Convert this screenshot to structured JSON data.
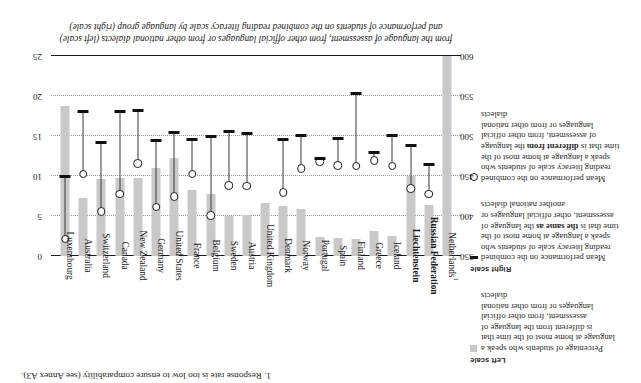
{
  "figure": {
    "caption": "from the language of assessment, from other official languages or from other national dialects (left scale) and performance of students on the combined reading literacy scale by language group (right scale)",
    "footnote": "1. Response rate is too low to ensure comparability (see Annex A3)."
  },
  "legend": {
    "left_scale_title": "Left scale",
    "right_scale_title": "Right scale",
    "entries": [
      {
        "marker": "grey-square-swatch",
        "scale": "left",
        "text_before": "Percentage of students who speak a language at home most of the time that is different from the language of assessment, from other official languages or from other national dialects",
        "emphasis": ""
      },
      {
        "marker": "black-dash",
        "scale": "right",
        "text_before": "Mean performance on the combined reading literacy scale of students who speak a language at home most of the time that is ",
        "emphasis": "the same as",
        "text_after": " the language of assessment, other official languages or another national dialects"
      },
      {
        "marker": "open-circle",
        "scale": "right",
        "text_before": "Mean performance on the combined reading literacy scale of students who speak a language at home most of the time that is ",
        "emphasis": "different from",
        "text_after": " the language of assessment, from other official languages or from other national dialects"
      }
    ]
  },
  "chart_data": {
    "type": "bar",
    "title": "",
    "subtitle": "",
    "xlabel": "",
    "ylabel_left": "Combined reading literacy scale (score)",
    "ylabel_right": "Percentage of students (%)",
    "grid": true,
    "legend_position": "left",
    "left_axis": {
      "name": "score",
      "ticks": [
        350,
        400,
        450,
        500,
        550,
        600
      ],
      "ylim": [
        350,
        600
      ],
      "inverted": false
    },
    "right_axis": {
      "name": "percent",
      "ticks": [
        0,
        5,
        10,
        15,
        20,
        25
      ],
      "ylim": [
        0,
        25
      ],
      "inverted": false
    },
    "categories": [
      "Netherlands¹",
      "Russian Federation",
      "Liechtenstein",
      "Iceland",
      "Greece",
      "Finland",
      "Spain",
      "Portugal",
      "Norway",
      "Denmark",
      "United Kingdom",
      "Austria",
      "Sweden",
      "Belgium",
      "France",
      "United States",
      "Germany",
      "New Zealand",
      "Canada",
      "Switzerland",
      "Australia",
      "Luxembourg"
    ],
    "bold_categories": [
      "Russian Federation",
      "Liechtenstein"
    ],
    "series": [
      {
        "name": "Percentage of students speaking a different language at home",
        "unit": "%",
        "axis": "right",
        "marker": "grey-bar",
        "values": [
          25.0,
          6.4,
          10.0,
          2.5,
          3.1,
          2.1,
          2.3,
          2.4,
          5.9,
          6.2,
          6.6,
          5.1,
          5.0,
          7.8,
          8.3,
          12.2,
          11.0,
          9.8,
          9.7,
          9.6,
          7.3,
          18.8
        ]
      },
      {
        "name": "Mean performance – language at home same as language of assessment",
        "unit": "score",
        "axis": "left",
        "marker": "black-dash",
        "values": [
          null,
          464,
          488,
          500,
          479,
          553,
          497,
          472,
          500,
          495,
          null,
          503,
          505,
          499,
          495,
          504,
          494,
          532,
          531,
          492,
          530,
          449
        ]
      },
      {
        "name": "Mean performance – language at home different from language of assessment",
        "unit": "score",
        "axis": "left",
        "marker": "open-circle",
        "values": [
          null,
          427,
          434,
          462,
          469,
          462,
          463,
          468,
          459,
          429,
          null,
          437,
          438,
          400,
          452,
          424,
          411,
          465,
          427,
          405,
          452,
          371
        ]
      }
    ]
  }
}
